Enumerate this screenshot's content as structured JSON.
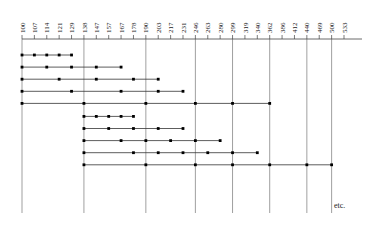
{
  "figure": {
    "etc_label": "etc.",
    "colors": {
      "axis": "#444444",
      "gridline": "#777777",
      "series_line": "#333333",
      "marker": "#000000",
      "text": "#1a1a1a",
      "background": "#ffffff"
    }
  },
  "chart_data": {
    "type": "line",
    "title": "",
    "subtitle": "",
    "xlabel": "",
    "ylabel": "",
    "grid": true,
    "legend_position": "none",
    "orientation": "horizontal",
    "annotations": [
      "etc."
    ],
    "axis_position": "top",
    "x_tick_labels": [
      "100",
      "107",
      "114",
      "121",
      "129",
      "138",
      "147",
      "157",
      "167",
      "178",
      "190",
      "203",
      "217",
      "231",
      "246",
      "263",
      "280",
      "299",
      "319",
      "340",
      "362",
      "386",
      "412",
      "440",
      "469",
      "500",
      "533"
    ],
    "x_tick_values": [
      100,
      107,
      114,
      121,
      129,
      138,
      147,
      157,
      167,
      178,
      190,
      203,
      217,
      231,
      246,
      263,
      280,
      299,
      319,
      340,
      362,
      386,
      412,
      440,
      469,
      500,
      533
    ],
    "gridline_values": [
      100,
      138,
      190,
      246,
      299,
      362,
      440,
      500
    ],
    "xlim": [
      100,
      533
    ],
    "ylim": [
      0,
      11
    ],
    "series": [
      {
        "name": "row-1",
        "y": 1,
        "x": [
          100,
          107,
          114,
          121,
          129
        ],
        "start": 100,
        "end": 129
      },
      {
        "name": "row-2",
        "y": 2,
        "x": [
          100,
          114,
          129,
          147,
          167
        ],
        "start": 100,
        "end": 167
      },
      {
        "name": "row-3",
        "y": 3,
        "x": [
          100,
          121,
          147,
          178,
          203
        ],
        "start": 100,
        "end": 203
      },
      {
        "name": "row-4",
        "y": 4,
        "x": [
          100,
          129,
          167,
          203,
          231
        ],
        "start": 100,
        "end": 231
      },
      {
        "name": "row-5",
        "y": 5,
        "x": [
          100,
          138,
          190,
          246,
          299,
          362
        ],
        "start": 100,
        "end": 362
      },
      {
        "name": "row-6",
        "y": 6,
        "x": [
          138,
          147,
          157,
          167,
          178
        ],
        "start": 138,
        "end": 178
      },
      {
        "name": "row-7",
        "y": 7,
        "x": [
          138,
          157,
          178,
          203,
          231
        ],
        "start": 138,
        "end": 231
      },
      {
        "name": "row-8",
        "y": 8,
        "x": [
          138,
          167,
          190,
          217,
          246,
          280
        ],
        "start": 138,
        "end": 280
      },
      {
        "name": "row-9",
        "y": 9,
        "x": [
          138,
          178,
          203,
          231,
          263,
          299,
          340
        ],
        "start": 138,
        "end": 340
      },
      {
        "name": "row-10",
        "y": 10,
        "x": [
          138,
          190,
          246,
          299,
          362,
          440,
          500
        ],
        "start": 138,
        "end": 500
      }
    ]
  }
}
